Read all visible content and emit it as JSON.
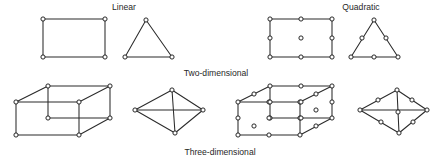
{
  "figure": {
    "background_color": "#ffffff",
    "line_color": "#2b2b2b",
    "node_fill_color": "#ffffff",
    "node_stroke_color": "#1e1e1e",
    "text_color": "#272727",
    "node_radius": 2.1,
    "width": 445,
    "height": 161
  },
  "captions": {
    "linear": {
      "text": "Linear",
      "x": 124,
      "y": 10
    },
    "quadratic": {
      "text": "Quadratic",
      "x": 361,
      "y": 10
    },
    "two_dimensional": {
      "text": "Two-dimensional",
      "x": 216,
      "y": 76
    },
    "three_dimensional": {
      "text": "Three-dimensional",
      "x": 220,
      "y": 155
    }
  },
  "elements": [
    {
      "id": "linear-quadrilateral",
      "name": "linear-quadrilateral",
      "order": "linear",
      "dimension": "two-dimensional",
      "node_count": 4,
      "nodes": [
        [
          43,
          19
        ],
        [
          105,
          19
        ],
        [
          105,
          57
        ],
        [
          43,
          57
        ]
      ],
      "edges": [
        [
          [
            43,
            19
          ],
          [
            105,
            19
          ]
        ],
        [
          [
            105,
            19
          ],
          [
            105,
            57
          ]
        ],
        [
          [
            105,
            57
          ],
          [
            43,
            57
          ]
        ],
        [
          [
            43,
            57
          ],
          [
            43,
            19
          ]
        ]
      ]
    },
    {
      "id": "linear-triangle",
      "name": "linear-triangle",
      "order": "linear",
      "dimension": "two-dimensional",
      "node_count": 3,
      "nodes": [
        [
          146,
          20
        ],
        [
          172,
          57
        ],
        [
          125,
          57
        ]
      ],
      "edges": [
        [
          [
            146,
            20
          ],
          [
            172,
            57
          ]
        ],
        [
          [
            172,
            57
          ],
          [
            125,
            57
          ]
        ],
        [
          [
            125,
            57
          ],
          [
            146,
            20
          ]
        ]
      ]
    },
    {
      "id": "quadratic-quadrilateral",
      "name": "quadratic-quadrilateral",
      "order": "quadratic",
      "dimension": "two-dimensional",
      "node_count": 9,
      "nodes": [
        [
          270,
          19
        ],
        [
          301,
          19
        ],
        [
          332,
          19
        ],
        [
          270,
          38
        ],
        [
          301,
          38
        ],
        [
          332,
          38
        ],
        [
          270,
          57
        ],
        [
          301,
          57
        ],
        [
          332,
          57
        ]
      ],
      "edges": [
        [
          [
            270,
            19
          ],
          [
            332,
            19
          ]
        ],
        [
          [
            332,
            19
          ],
          [
            332,
            57
          ]
        ],
        [
          [
            332,
            57
          ],
          [
            270,
            57
          ]
        ],
        [
          [
            270,
            57
          ],
          [
            270,
            19
          ]
        ]
      ]
    },
    {
      "id": "quadratic-triangle",
      "name": "quadratic-triangle",
      "order": "quadratic",
      "dimension": "two-dimensional",
      "node_count": 6,
      "nodes": [
        [
          374,
          20
        ],
        [
          386,
          38
        ],
        [
          398,
          57
        ],
        [
          374,
          57
        ],
        [
          351,
          57
        ],
        [
          362,
          38
        ]
      ],
      "edges": [
        [
          [
            374,
            20
          ],
          [
            398,
            57
          ]
        ],
        [
          [
            398,
            57
          ],
          [
            351,
            57
          ]
        ],
        [
          [
            351,
            57
          ],
          [
            374,
            20
          ]
        ]
      ]
    },
    {
      "id": "linear-hexahedron",
      "name": "linear-hexahedron",
      "order": "linear",
      "dimension": "three-dimensional",
      "node_count": 8,
      "nodes": [
        [
          16,
          102
        ],
        [
          79,
          102
        ],
        [
          79,
          135
        ],
        [
          16,
          135
        ],
        [
          48,
          86
        ],
        [
          110,
          86
        ],
        [
          110,
          118
        ],
        [
          48,
          118
        ]
      ],
      "edges": [
        [
          [
            16,
            102
          ],
          [
            79,
            102
          ]
        ],
        [
          [
            79,
            102
          ],
          [
            79,
            135
          ]
        ],
        [
          [
            79,
            135
          ],
          [
            16,
            135
          ]
        ],
        [
          [
            16,
            135
          ],
          [
            16,
            102
          ]
        ],
        [
          [
            48,
            86
          ],
          [
            110,
            86
          ]
        ],
        [
          [
            110,
            86
          ],
          [
            110,
            118
          ]
        ],
        [
          [
            110,
            118
          ],
          [
            48,
            118
          ]
        ],
        [
          [
            48,
            118
          ],
          [
            48,
            86
          ]
        ],
        [
          [
            16,
            102
          ],
          [
            48,
            86
          ]
        ],
        [
          [
            79,
            102
          ],
          [
            110,
            86
          ]
        ],
        [
          [
            79,
            135
          ],
          [
            110,
            118
          ]
        ]
      ]
    },
    {
      "id": "linear-tetrahedron",
      "name": "linear-tetrahedron",
      "order": "linear",
      "dimension": "three-dimensional",
      "node_count": 4,
      "nodes": [
        [
          172,
          90
        ],
        [
          135,
          110
        ],
        [
          203,
          110
        ],
        [
          175,
          133
        ]
      ],
      "edges": [
        [
          [
            172,
            90
          ],
          [
            135,
            110
          ]
        ],
        [
          [
            172,
            90
          ],
          [
            203,
            110
          ]
        ],
        [
          [
            172,
            90
          ],
          [
            175,
            133
          ]
        ],
        [
          [
            135,
            110
          ],
          [
            175,
            133
          ]
        ],
        [
          [
            203,
            110
          ],
          [
            175,
            133
          ]
        ],
        [
          [
            135,
            110
          ],
          [
            203,
            110
          ]
        ]
      ]
    },
    {
      "id": "quadratic-hexahedron",
      "name": "quadratic-hexahedron",
      "order": "quadratic",
      "dimension": "three-dimensional",
      "node_count": 20,
      "nodes": [
        [
          238,
          102
        ],
        [
          269,
          102
        ],
        [
          300,
          102
        ],
        [
          300,
          118
        ],
        [
          300,
          135
        ],
        [
          269,
          135
        ],
        [
          238,
          135
        ],
        [
          238,
          118
        ],
        [
          270,
          86
        ],
        [
          301,
          86
        ],
        [
          332,
          86
        ],
        [
          332,
          102
        ],
        [
          332,
          118
        ],
        [
          301,
          118
        ],
        [
          270,
          118
        ],
        [
          270,
          102
        ],
        [
          254,
          94
        ],
        [
          316,
          94
        ],
        [
          316,
          126
        ],
        [
          254,
          126
        ]
      ],
      "face_center_nodes": [
        [
          269,
          118
        ],
        [
          301,
          102
        ],
        [
          316,
          110
        ]
      ],
      "edges": [
        [
          [
            238,
            102
          ],
          [
            300,
            102
          ]
        ],
        [
          [
            300,
            102
          ],
          [
            300,
            135
          ]
        ],
        [
          [
            300,
            135
          ],
          [
            238,
            135
          ]
        ],
        [
          [
            238,
            135
          ],
          [
            238,
            102
          ]
        ],
        [
          [
            270,
            86
          ],
          [
            332,
            86
          ]
        ],
        [
          [
            332,
            86
          ],
          [
            332,
            118
          ]
        ],
        [
          [
            332,
            118
          ],
          [
            270,
            118
          ]
        ],
        [
          [
            270,
            118
          ],
          [
            270,
            86
          ]
        ],
        [
          [
            238,
            102
          ],
          [
            270,
            86
          ]
        ],
        [
          [
            300,
            102
          ],
          [
            332,
            86
          ]
        ],
        [
          [
            300,
            135
          ],
          [
            332,
            118
          ]
        ]
      ]
    },
    {
      "id": "quadratic-tetrahedron",
      "name": "quadratic-tetrahedron",
      "order": "quadratic",
      "dimension": "three-dimensional",
      "node_count": 10,
      "nodes": [
        [
          397,
          90
        ],
        [
          378,
          100
        ],
        [
          360,
          110
        ],
        [
          412,
          100
        ],
        [
          427,
          110
        ],
        [
          398,
          112
        ],
        [
          399,
          133
        ],
        [
          381,
          122
        ],
        [
          413,
          122
        ]
      ],
      "edges": [
        [
          [
            397,
            90
          ],
          [
            360,
            110
          ]
        ],
        [
          [
            397,
            90
          ],
          [
            427,
            110
          ]
        ],
        [
          [
            397,
            90
          ],
          [
            399,
            133
          ]
        ],
        [
          [
            360,
            110
          ],
          [
            399,
            133
          ]
        ],
        [
          [
            427,
            110
          ],
          [
            399,
            133
          ]
        ],
        [
          [
            360,
            110
          ],
          [
            427,
            110
          ]
        ]
      ]
    }
  ]
}
